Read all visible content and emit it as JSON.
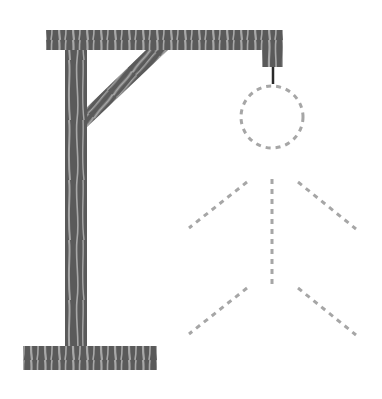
{
  "game": {
    "name": "hangman",
    "gallows": {
      "wood_dark": "#5a5a5a",
      "wood_light": "#a8a8a8",
      "rope_color": "#2a2a2a"
    },
    "figure": {
      "state": "outline-dashed",
      "stroke_color": "#a6a6a6",
      "parts": [
        "head",
        "body",
        "left-arm",
        "right-arm",
        "left-leg",
        "right-leg"
      ]
    }
  }
}
